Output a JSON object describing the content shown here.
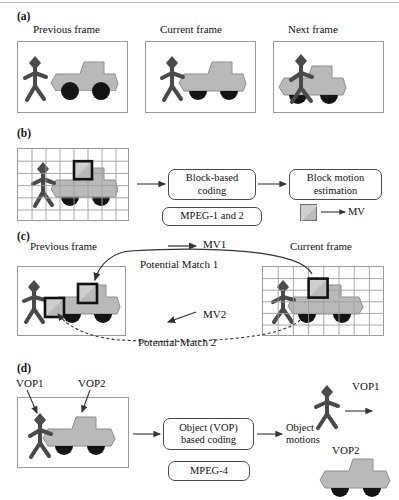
{
  "figure": {
    "colors": {
      "truck_body": "#b9b9b9",
      "truck_outline": "#8d8d8d",
      "wheel": "#141414",
      "person": "#4a4a4a",
      "frame_border": "#9a9a9a",
      "grid_line": "#9e9e9e",
      "block_highlight": "#111111",
      "text": "#111111",
      "arrow": "#333333"
    },
    "panels": [
      {
        "id": "a",
        "label": "(a)",
        "frames": [
          {
            "name": "previous-frame",
            "caption": "Previous frame"
          },
          {
            "name": "current-frame",
            "caption": "Current frame"
          },
          {
            "name": "next-frame",
            "caption": "Next frame"
          }
        ]
      },
      {
        "id": "b",
        "label": "(b)",
        "grid": {
          "cols": 8,
          "rows": 6
        },
        "boxes": [
          {
            "name": "block-based-coding-box",
            "lines": [
              "Block-based",
              "coding"
            ]
          },
          {
            "name": "block-motion-estimation-box",
            "lines": [
              "Block motion",
              "estimation"
            ]
          },
          {
            "name": "mpeg-1-and-2-box",
            "lines": [
              "MPEG-1 and 2"
            ]
          }
        ],
        "legend": {
          "name": "mv-legend",
          "label": "MV"
        }
      },
      {
        "id": "c",
        "label": "(c)",
        "frames": [
          {
            "name": "previous-frame",
            "caption": "Previous frame"
          },
          {
            "name": "current-frame",
            "caption": "Current frame"
          }
        ],
        "grid": {
          "cols": 8,
          "rows": 6
        },
        "annotations": [
          {
            "name": "mv1-label",
            "label": "MV1"
          },
          {
            "name": "potential-match-1-label",
            "label": "Potential Match 1"
          },
          {
            "name": "mv2-label",
            "label": "MV2"
          },
          {
            "name": "potential-match-2-label",
            "label": "Potential Match 2"
          }
        ]
      },
      {
        "id": "d",
        "label": "(d)",
        "vop_labels": [
          {
            "name": "vop1-label-frame",
            "label": "VOP1"
          },
          {
            "name": "vop2-label-frame",
            "label": "VOP2"
          },
          {
            "name": "vop1-label-object",
            "label": "VOP1"
          },
          {
            "name": "vop2-label-object",
            "label": "VOP2"
          }
        ],
        "boxes": [
          {
            "name": "object-vop-based-coding-box",
            "lines": [
              "Object (VOP)",
              "based coding"
            ]
          },
          {
            "name": "mpeg-4-box",
            "lines": [
              "MPEG-4"
            ]
          }
        ],
        "output": {
          "name": "object-motions-label",
          "lines": [
            "Object",
            "motions"
          ]
        }
      }
    ]
  },
  "panel_a": {
    "label": "(a)",
    "frame1_caption": "Previous frame",
    "frame2_caption": "Current frame",
    "frame3_caption": "Next frame"
  },
  "panel_b": {
    "label": "(b)",
    "box1_line1": "Block-based",
    "box1_line2": "coding",
    "box2_line1": "Block motion",
    "box2_line2": "estimation",
    "box3_line1": "MPEG-1 and 2",
    "mv_label": "MV"
  },
  "panel_c": {
    "label": "(c)",
    "frame1_caption": "Previous frame",
    "frame2_caption": "Current frame",
    "mv1_label": "MV1",
    "match1_label": "Potential Match 1",
    "mv2_label": "MV2",
    "match2_label": "Potential Match 2"
  },
  "panel_d": {
    "label": "(d)",
    "vop1_frame_label": "VOP1",
    "vop2_frame_label": "VOP2",
    "box1_line1": "Object (VOP)",
    "box1_line2": "based coding",
    "box2_line1": "MPEG-4",
    "out_line1": "Object",
    "out_line2": "motions",
    "vop1_object_label": "VOP1",
    "vop2_object_label": "VOP2"
  }
}
